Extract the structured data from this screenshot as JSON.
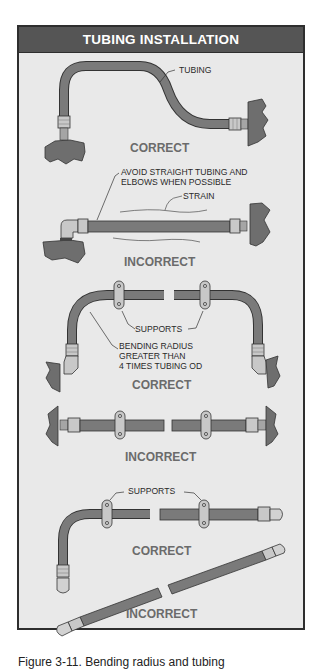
{
  "figure": {
    "title": "TUBING INSTALLATION",
    "caption": "Figure 3-11. Bending radius and tubing",
    "colors": {
      "title_bar": "#555555",
      "panel_bg": "#e9e9e9",
      "tube": "#7a7a7a",
      "fitting": "#c8c8c8",
      "surface": "#6e6e6e",
      "verdict_text": "#6b6b6b"
    },
    "panels": [
      {
        "id": "panel-1",
        "verdict": "CORRECT",
        "labels": {
          "tubing": "TUBING"
        }
      },
      {
        "id": "panel-2",
        "verdict": "INCORRECT",
        "labels": {
          "avoid_line1": "AVOID STRAIGHT TUBING AND",
          "avoid_line2": "ELBOWS WHEN POSSIBLE",
          "strain": "STRAIN"
        }
      },
      {
        "id": "panel-3",
        "verdict": "CORRECT",
        "labels": {
          "supports": "SUPPORTS",
          "bend_line1": "BENDING RADIUS",
          "bend_line2": "GREATER THAN",
          "bend_line3": "4 TIMES TUBING OD"
        }
      },
      {
        "id": "panel-4",
        "verdict": "INCORRECT",
        "labels": {}
      },
      {
        "id": "panel-5",
        "verdict": "CORRECT",
        "labels": {
          "supports": "SUPPORTS"
        }
      },
      {
        "id": "panel-6",
        "verdict": "INCORRECT",
        "labels": {}
      }
    ]
  }
}
